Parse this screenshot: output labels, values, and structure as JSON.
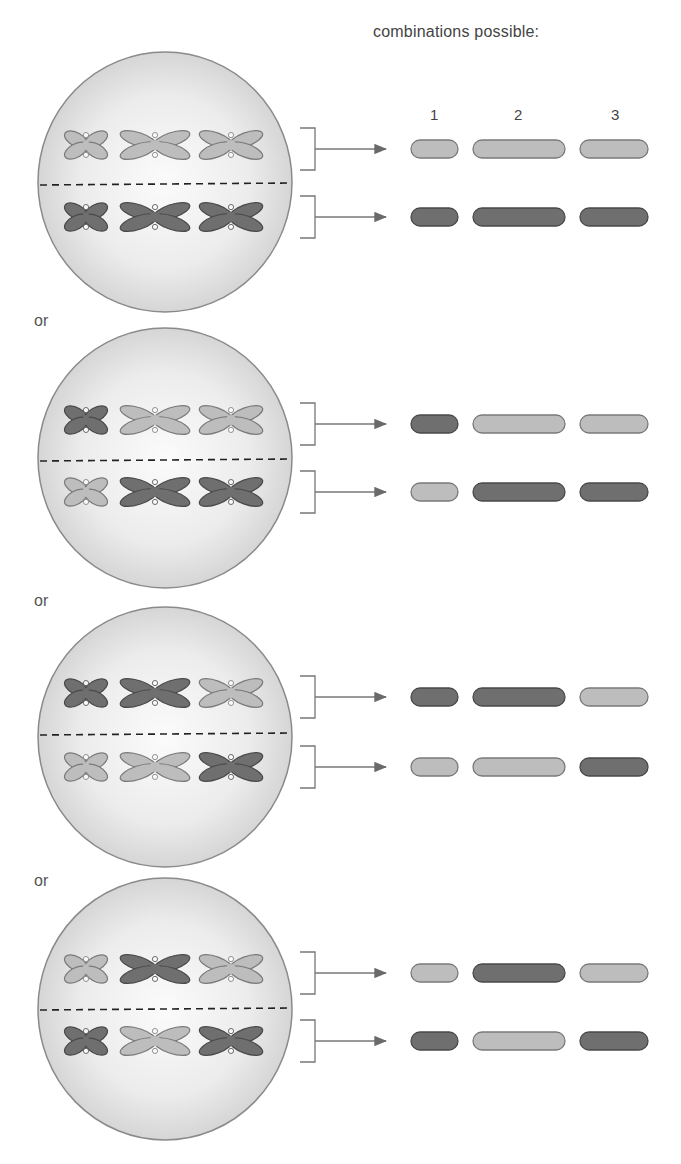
{
  "header": {
    "title": "combinations possible:"
  },
  "cell_labels": [
    "1",
    "2",
    "3"
  ],
  "result_labels": [
    "1",
    "2",
    "3"
  ],
  "separator_label": "or",
  "colors": {
    "light": "#bdbdbd",
    "light_stroke": "#7a7a7a",
    "dark": "#6f6f6f",
    "dark_stroke": "#4a4a4a",
    "cell_fill": "#e4e4e4",
    "cell_stroke": "#8a8a8a"
  },
  "panels": [
    {
      "top_row": [
        "light",
        "light",
        "light"
      ],
      "bottom_row": [
        "dark",
        "dark",
        "dark"
      ],
      "combination_top": [
        "light",
        "light",
        "light"
      ],
      "combination_bottom": [
        "dark",
        "dark",
        "dark"
      ]
    },
    {
      "top_row": [
        "dark",
        "light",
        "light"
      ],
      "bottom_row": [
        "light",
        "dark",
        "dark"
      ],
      "combination_top": [
        "dark",
        "light",
        "light"
      ],
      "combination_bottom": [
        "light",
        "dark",
        "dark"
      ]
    },
    {
      "top_row": [
        "dark",
        "dark",
        "light"
      ],
      "bottom_row": [
        "light",
        "light",
        "dark"
      ],
      "combination_top": [
        "dark",
        "dark",
        "light"
      ],
      "combination_bottom": [
        "light",
        "light",
        "dark"
      ]
    },
    {
      "top_row": [
        "light",
        "dark",
        "light"
      ],
      "bottom_row": [
        "dark",
        "light",
        "dark"
      ],
      "combination_top": [
        "light",
        "dark",
        "light"
      ],
      "combination_bottom": [
        "dark",
        "light",
        "dark"
      ]
    }
  ]
}
